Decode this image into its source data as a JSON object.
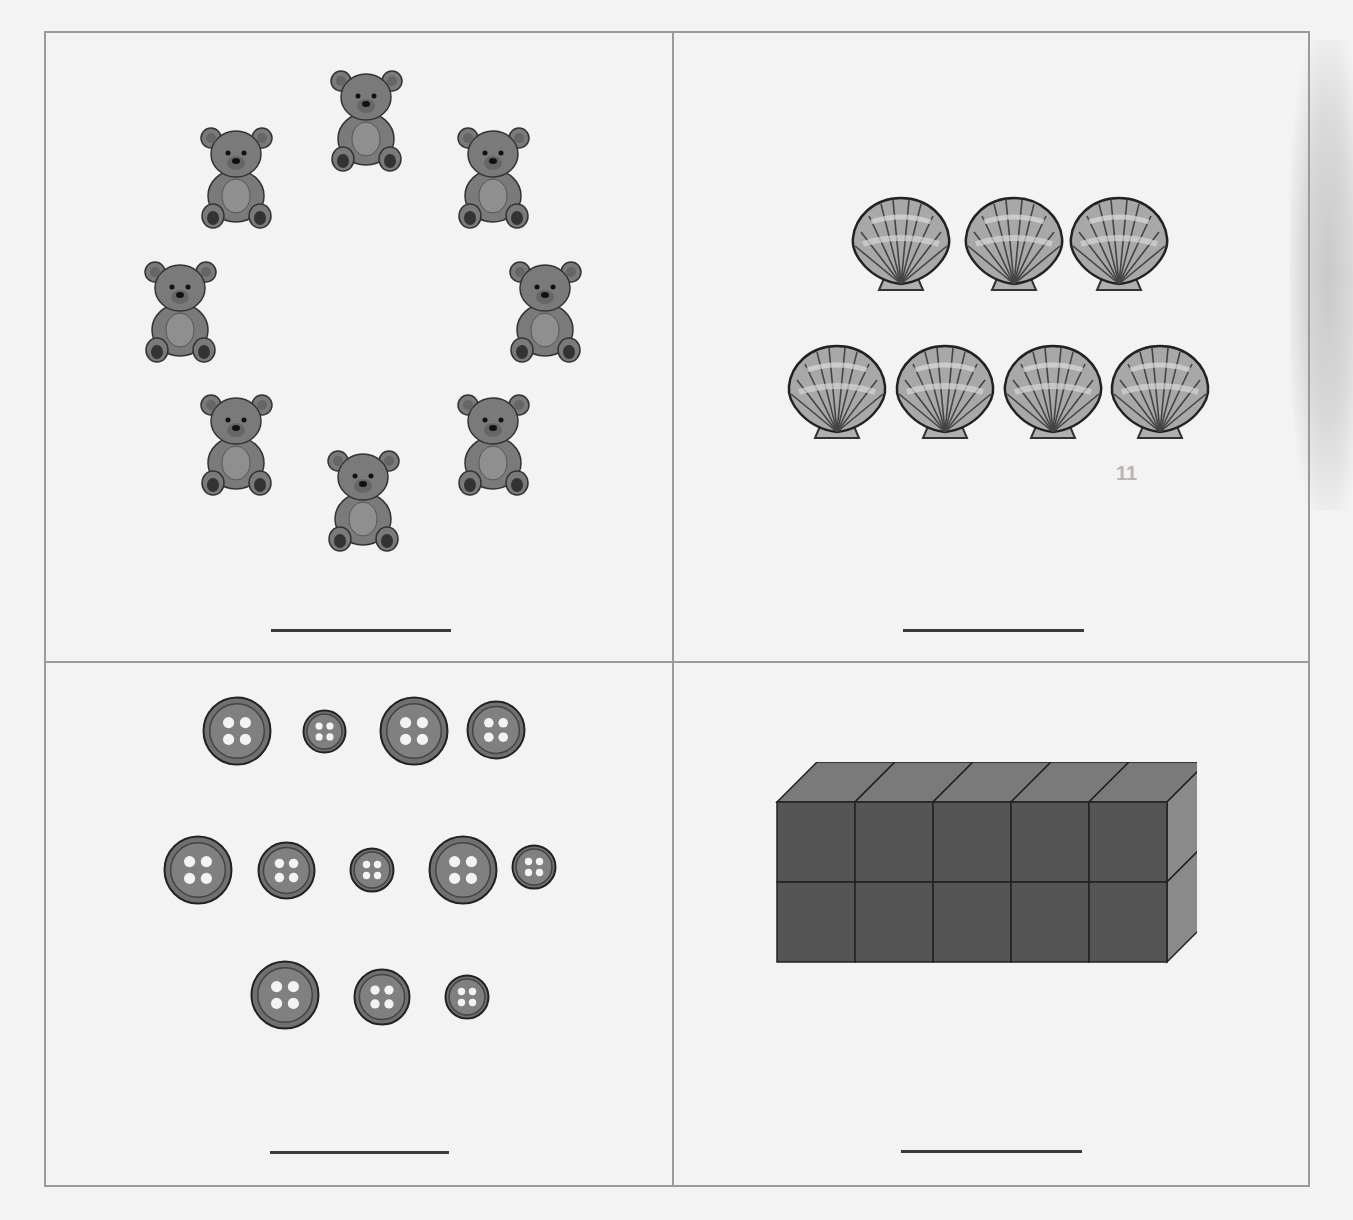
{
  "worksheet": {
    "task": "Count the objects in each box and write the number on the line",
    "panels": [
      {
        "id": "bears",
        "object": "teddy bear",
        "icon": "teddy-bear-icon",
        "count": 8,
        "answer": "",
        "positions": [
          [
            329,
            67
          ],
          [
            199,
            124
          ],
          [
            456,
            124
          ],
          [
            143,
            258
          ],
          [
            508,
            258
          ],
          [
            199,
            391
          ],
          [
            456,
            391
          ],
          [
            326,
            447
          ]
        ]
      },
      {
        "id": "shells",
        "object": "scallop shell",
        "icon": "seashell-icon",
        "count": 7,
        "rows": [
          3,
          4
        ],
        "answer": ""
      },
      {
        "id": "buttons",
        "object": "sewing button",
        "icon": "button-icon",
        "count": 12,
        "rows": [
          4,
          5,
          3
        ],
        "answer": ""
      },
      {
        "id": "cubes",
        "object": "unit cube",
        "icon": "cube-icon",
        "count": 10,
        "columns": 5,
        "layers": 2,
        "answer": ""
      }
    ],
    "ghost_mark": "11",
    "colors": {
      "paper": "#f3f3f3",
      "border": "#9a9a9a",
      "ink": "#3a3a3a",
      "bear": "#7a7a7a",
      "shell": "#a8a8a8",
      "button": "#707070",
      "cube_front": "#555555",
      "cube_top": "#7a7a7a",
      "cube_side": "#8a8a8a"
    }
  }
}
